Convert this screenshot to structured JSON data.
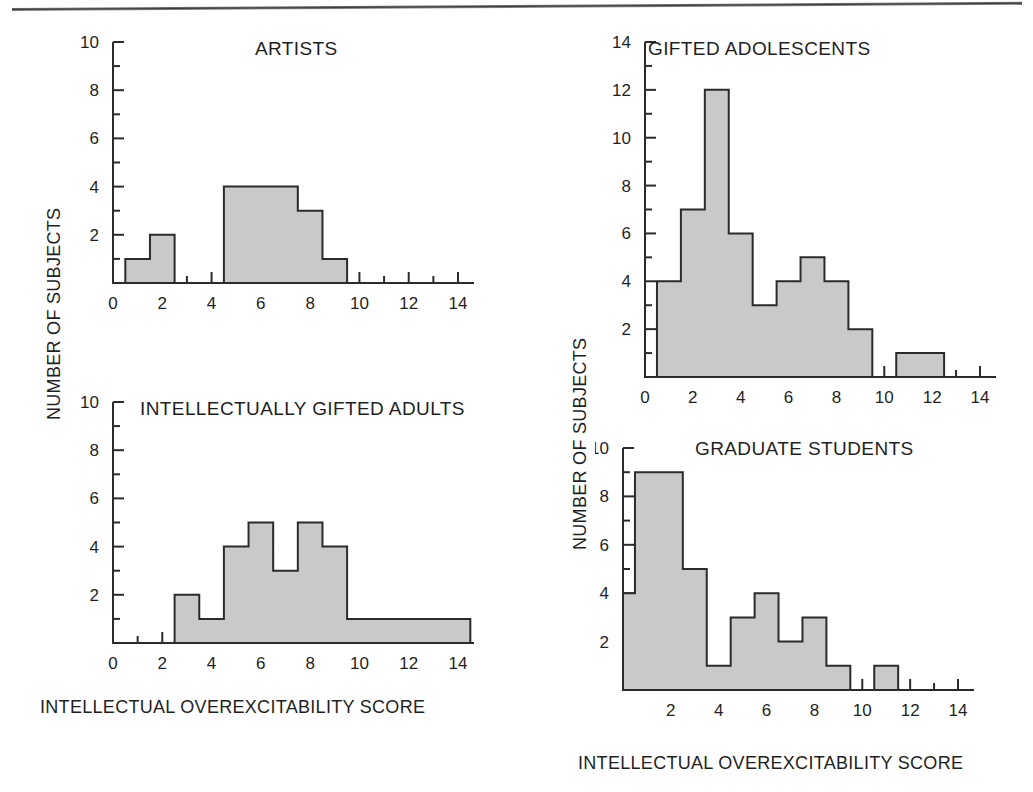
{
  "figure": {
    "axis_titles": {
      "y": "NUMBER OF SUBJECTS",
      "x": "INTELLECTUAL OVEREXCITABILITY SCORE"
    },
    "colors": {
      "bar_fill": "#c9c9c9",
      "bar_stroke": "#2b2b2b",
      "axis": "#2b2b2b",
      "text": "#1f1f1f",
      "background": "#ffffff"
    }
  },
  "chart_data": [
    {
      "type": "bar",
      "id": "artists",
      "title": "ARTISTS",
      "xlabel": "INTELLECTUAL OVEREXCITABILITY SCORE",
      "ylabel": "NUMBER OF SUBJECTS",
      "xlim": [
        0,
        14
      ],
      "ylim": [
        0,
        10
      ],
      "xticks": [
        0,
        2,
        4,
        6,
        8,
        10,
        12,
        14
      ],
      "yticks": [
        2,
        4,
        6,
        8,
        10
      ],
      "minor_tick_step": 1,
      "grid": false,
      "legend": "none",
      "bins": [
        {
          "start": 0.5,
          "end": 1.5,
          "value": 1
        },
        {
          "start": 1.5,
          "end": 2.5,
          "value": 2
        },
        {
          "start": 4.5,
          "end": 7.5,
          "value": 4
        },
        {
          "start": 7.5,
          "end": 8.5,
          "value": 3
        },
        {
          "start": 8.5,
          "end": 9.5,
          "value": 1
        }
      ]
    },
    {
      "type": "bar",
      "id": "intellectually-gifted-adults",
      "title": "INTELLECTUALLY GIFTED ADULTS",
      "xlabel": "INTELLECTUAL OVEREXCITABILITY SCORE",
      "ylabel": "NUMBER OF SUBJECTS",
      "xlim": [
        0,
        14
      ],
      "ylim": [
        0,
        10
      ],
      "xticks": [
        0,
        2,
        4,
        6,
        8,
        10,
        12,
        14
      ],
      "yticks": [
        2,
        4,
        6,
        8,
        10
      ],
      "minor_tick_step": 1,
      "grid": false,
      "legend": "none",
      "bins": [
        {
          "start": 2.5,
          "end": 3.5,
          "value": 2
        },
        {
          "start": 3.5,
          "end": 4.5,
          "value": 1
        },
        {
          "start": 4.5,
          "end": 5.5,
          "value": 4
        },
        {
          "start": 5.5,
          "end": 6.5,
          "value": 5
        },
        {
          "start": 6.5,
          "end": 7.5,
          "value": 3
        },
        {
          "start": 7.5,
          "end": 8.5,
          "value": 5
        },
        {
          "start": 8.5,
          "end": 9.5,
          "value": 4
        },
        {
          "start": 9.5,
          "end": 14.5,
          "value": 1
        }
      ]
    },
    {
      "type": "bar",
      "id": "gifted-adolescents",
      "title": "GIFTED ADOLESCENTS",
      "xlabel": "INTELLECTUAL OVEREXCITABILITY SCORE",
      "ylabel": "NUMBER OF SUBJECTS",
      "xlim": [
        0,
        14
      ],
      "ylim": [
        0,
        14
      ],
      "xticks": [
        0,
        2,
        4,
        6,
        8,
        10,
        12,
        14
      ],
      "yticks": [
        2,
        4,
        6,
        8,
        10,
        12,
        14
      ],
      "minor_tick_step": 1,
      "grid": false,
      "legend": "none",
      "bins": [
        {
          "start": 0.5,
          "end": 1.5,
          "value": 4
        },
        {
          "start": 1.5,
          "end": 2.5,
          "value": 7
        },
        {
          "start": 2.5,
          "end": 3.5,
          "value": 12
        },
        {
          "start": 3.5,
          "end": 4.5,
          "value": 6
        },
        {
          "start": 4.5,
          "end": 5.5,
          "value": 3
        },
        {
          "start": 5.5,
          "end": 6.5,
          "value": 4
        },
        {
          "start": 6.5,
          "end": 7.5,
          "value": 5
        },
        {
          "start": 7.5,
          "end": 8.5,
          "value": 4
        },
        {
          "start": 8.5,
          "end": 9.5,
          "value": 2
        },
        {
          "start": 10.5,
          "end": 12.5,
          "value": 1
        }
      ]
    },
    {
      "type": "bar",
      "id": "graduate-students",
      "title": "GRADUATE STUDENTS",
      "xlabel": "INTELLECTUAL OVEREXCITABILITY SCORE",
      "ylabel": "NUMBER OF SUBJECTS",
      "xlim": [
        0,
        14
      ],
      "ylim": [
        0,
        10
      ],
      "xticks": [
        2,
        4,
        6,
        8,
        10,
        12,
        14
      ],
      "yticks": [
        2,
        4,
        6,
        8,
        10
      ],
      "minor_tick_step": 1,
      "grid": false,
      "legend": "none",
      "bins": [
        {
          "start": 0.0,
          "end": 0.5,
          "value": 4
        },
        {
          "start": 0.5,
          "end": 2.5,
          "value": 9
        },
        {
          "start": 2.5,
          "end": 3.5,
          "value": 5
        },
        {
          "start": 3.5,
          "end": 4.5,
          "value": 1
        },
        {
          "start": 4.5,
          "end": 5.5,
          "value": 3
        },
        {
          "start": 5.5,
          "end": 6.5,
          "value": 4
        },
        {
          "start": 6.5,
          "end": 7.5,
          "value": 2
        },
        {
          "start": 7.5,
          "end": 8.5,
          "value": 3
        },
        {
          "start": 8.5,
          "end": 9.5,
          "value": 1
        },
        {
          "start": 10.5,
          "end": 11.5,
          "value": 1
        }
      ]
    }
  ],
  "labels": {
    "artists_title": "ARTISTS",
    "adults_title": "INTELLECTUALLY GIFTED ADULTS",
    "adolescents_title": "GIFTED ADOLESCENTS",
    "graduate_title": "GRADUATE STUDENTS",
    "y_axis_left": "NUMBER OF SUBJECTS",
    "y_axis_right": "NUMBER OF SUBJECTS",
    "x_axis_left": "INTELLECTUAL OVEREXCITABILITY SCORE",
    "x_axis_right": "INTELLECTUAL OVEREXCITABILITY SCORE"
  }
}
